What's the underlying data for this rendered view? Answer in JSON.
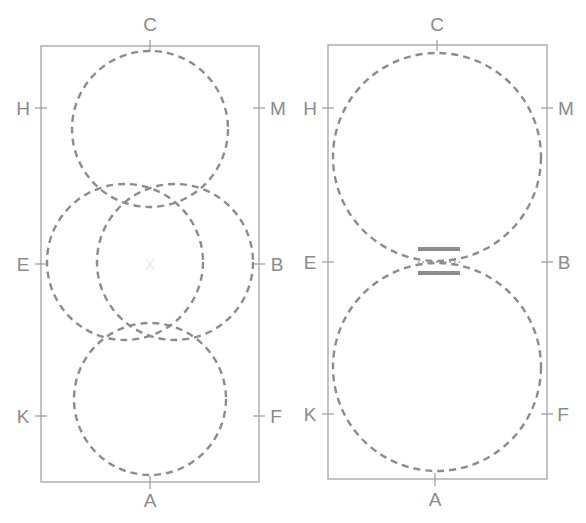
{
  "colors": {
    "rectangle": "#a3a3a3",
    "dashed_circle": "#8c8c8c",
    "label": "#8a8a8a",
    "center_mark": "#ececec"
  },
  "left_panel": {
    "labels": {
      "top": "C",
      "bottom": "A",
      "upper_left": "H",
      "upper_right": "M",
      "mid_left": "E",
      "mid_right": "B",
      "lower_left": "K",
      "lower_right": "F"
    },
    "center_mark": "x",
    "circles": 4
  },
  "right_panel": {
    "labels": {
      "top": "C",
      "bottom": "A",
      "upper_left": "H",
      "upper_right": "M",
      "mid_left": "E",
      "mid_right": "B",
      "lower_left": "K",
      "lower_right": "F"
    },
    "circles": 2,
    "connector": "two parallel bars with dotted line between tangent circles"
  }
}
